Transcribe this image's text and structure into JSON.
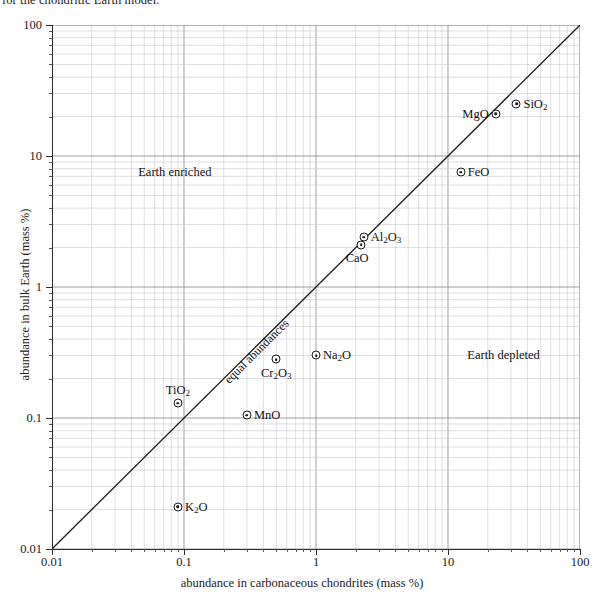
{
  "caption": {
    "text": "for the chondritic Earth model."
  },
  "chart_data": {
    "type": "scatter",
    "title": "",
    "xlabel": "abundance in carbonaceous chondrites (mass %)",
    "ylabel": "abundance in bulk Earth (mass %)",
    "xscale": "log",
    "yscale": "log",
    "xlim": [
      0.01,
      100
    ],
    "ylim": [
      0.01,
      100
    ],
    "grid": true,
    "grid_minor": true,
    "legend": "none",
    "xticks": [
      "0.01",
      "0.1",
      "1",
      "10",
      "100"
    ],
    "xtick_values": [
      0.01,
      0.1,
      1,
      10,
      100
    ],
    "yticks": [
      "0.01",
      "0.1",
      "1",
      "10",
      "100"
    ],
    "ytick_values": [
      0.01,
      0.1,
      1,
      10,
      100
    ],
    "points": [
      {
        "label": "SiO2",
        "label_html": "SiO<sub>2</sub>",
        "x": 33.0,
        "y": 25.0,
        "label_pos": "right"
      },
      {
        "label": "MgO",
        "label_html": "MgO",
        "x": 23.0,
        "y": 21.0,
        "label_pos": "left"
      },
      {
        "label": "FeO",
        "label_html": "FeO",
        "x": 12.5,
        "y": 7.5,
        "label_pos": "right"
      },
      {
        "label": "Al2O3",
        "label_html": "Al<sub>2</sub>O<sub>3</sub>",
        "x": 2.3,
        "y": 2.4,
        "label_pos": "right"
      },
      {
        "label": "CaO",
        "label_html": "CaO",
        "x": 2.2,
        "y": 2.1,
        "label_pos": "below-left"
      },
      {
        "label": "Na2O",
        "label_html": "Na<sub>2</sub>O",
        "x": 1.0,
        "y": 0.3,
        "label_pos": "right"
      },
      {
        "label": "Cr2O3",
        "label_html": "Cr<sub>2</sub>O<sub>3</sub>",
        "x": 0.5,
        "y": 0.28,
        "label_pos": "below"
      },
      {
        "label": "MnO",
        "label_html": "MnO",
        "x": 0.3,
        "y": 0.105,
        "label_pos": "right"
      },
      {
        "label": "TiO2",
        "label_html": "TiO<sub>2</sub>",
        "x": 0.09,
        "y": 0.13,
        "label_pos": "above"
      },
      {
        "label": "K2O",
        "label_html": "K<sub>2</sub>O",
        "x": 0.09,
        "y": 0.021,
        "label_pos": "right"
      }
    ],
    "reference_line": {
      "label": "equal abundances",
      "from": [
        0.01,
        0.01
      ],
      "to": [
        100,
        100
      ]
    },
    "annotations": [
      {
        "text": "Earth enriched",
        "x": 0.045,
        "y": 7.6
      },
      {
        "text": "Earth depleted",
        "x": 14.0,
        "y": 0.3
      }
    ]
  }
}
